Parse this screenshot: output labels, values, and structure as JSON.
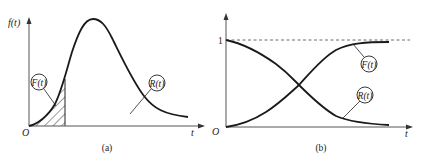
{
  "figure": {
    "panel_a": {
      "caption": "(a)",
      "y_axis_label": "f(t)",
      "x_axis_label": "t",
      "origin_label": "O",
      "curve": "probability density f(t)",
      "annotations": [
        {
          "text": "F(t)",
          "refers_to": "hatched area under f(t) from 0 to t"
        },
        {
          "text": "R(t)",
          "refers_to": "area under f(t) beyond t"
        }
      ]
    },
    "panel_b": {
      "caption": "(b)",
      "y_tick_label": "1",
      "x_axis_label": "t",
      "origin_label": "O",
      "curves": [
        {
          "text": "F(t)",
          "shape": "increasing S-curve from 0 toward 1"
        },
        {
          "text": "R(t)",
          "shape": "decreasing S-curve from 1 toward 0"
        }
      ],
      "asymptote": "dashed line at 1"
    }
  },
  "colors": {
    "stroke": "#1a1a1a",
    "axis": "#555555",
    "background": "#ffffff"
  }
}
